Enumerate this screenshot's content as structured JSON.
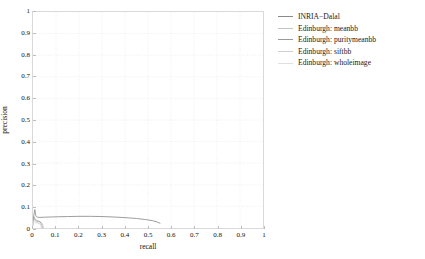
{
  "chart_data": {
    "type": "line",
    "title": "",
    "xlabel": "recall",
    "ylabel": "precision",
    "xlim": [
      0,
      1
    ],
    "ylim": [
      0,
      1
    ],
    "xticks": [
      "0",
      "0.1",
      "0.2",
      "0.3",
      "0.4",
      "0.5",
      "0.6",
      "0.7",
      "0.8",
      "0.9",
      "1"
    ],
    "xtick_values": [
      0,
      0.1,
      0.2,
      0.3,
      0.4,
      0.5,
      0.6,
      0.7,
      0.8,
      0.9,
      1
    ],
    "yticks": [
      "0",
      "0.1",
      "0.2",
      "0.3",
      "0.4",
      "0.5",
      "0.6",
      "0.7",
      "0.8",
      "0.9",
      "1"
    ],
    "ytick_values": [
      0,
      0.1,
      0.2,
      0.3,
      0.4,
      0.5,
      0.6,
      0.7,
      0.8,
      0.9,
      1
    ],
    "grid": true,
    "grid_style": "dotted",
    "legend_position": "right-outside",
    "series": [
      {
        "name": "INRIA-Dalal",
        "color": "#8a8a8a",
        "points": [
          [
            0.0,
            0.02
          ],
          [
            0.002,
            0.048
          ],
          [
            0.004,
            0.062
          ],
          [
            0.006,
            0.074
          ],
          [
            0.008,
            0.085
          ],
          [
            0.01,
            0.07
          ],
          [
            0.012,
            0.058
          ],
          [
            0.015,
            0.052
          ],
          [
            0.02,
            0.05
          ],
          [
            0.03,
            0.049
          ],
          [
            0.05,
            0.05
          ],
          [
            0.08,
            0.051
          ],
          [
            0.11,
            0.052
          ],
          [
            0.15,
            0.053
          ],
          [
            0.2,
            0.054
          ],
          [
            0.25,
            0.054
          ],
          [
            0.3,
            0.053
          ],
          [
            0.35,
            0.051
          ],
          [
            0.4,
            0.048
          ],
          [
            0.45,
            0.044
          ],
          [
            0.49,
            0.039
          ],
          [
            0.52,
            0.034
          ],
          [
            0.54,
            0.028
          ],
          [
            0.552,
            0.022
          ]
        ]
      },
      {
        "name": "Edinburgh: meanbb",
        "color": "#c4c4c4",
        "points": [
          [
            0.0,
            0.015
          ],
          [
            0.002,
            0.034
          ],
          [
            0.004,
            0.044
          ],
          [
            0.006,
            0.04
          ],
          [
            0.009,
            0.036
          ],
          [
            0.013,
            0.033
          ],
          [
            0.018,
            0.031
          ],
          [
            0.024,
            0.03
          ],
          [
            0.03,
            0.029
          ],
          [
            0.036,
            0.026
          ],
          [
            0.04,
            0.02
          ],
          [
            0.043,
            0.012
          ],
          [
            0.045,
            0.005
          ],
          [
            0.046,
            0.0
          ]
        ]
      },
      {
        "name": "Edinburgh: puritymeanbb",
        "color": "#9a9a9a",
        "points": [
          [
            0.0,
            0.018
          ],
          [
            0.002,
            0.04
          ],
          [
            0.004,
            0.052
          ],
          [
            0.006,
            0.046
          ],
          [
            0.009,
            0.042
          ],
          [
            0.012,
            0.038
          ],
          [
            0.016,
            0.035
          ],
          [
            0.021,
            0.033
          ],
          [
            0.026,
            0.031
          ],
          [
            0.031,
            0.028
          ],
          [
            0.035,
            0.022
          ],
          [
            0.038,
            0.014
          ],
          [
            0.04,
            0.006
          ],
          [
            0.041,
            0.0
          ]
        ]
      },
      {
        "name": "Edinburgh: siftbb",
        "color": "#d0d0d0",
        "points": [
          [
            0.0,
            0.012
          ],
          [
            0.002,
            0.028
          ],
          [
            0.004,
            0.036
          ],
          [
            0.006,
            0.033
          ],
          [
            0.009,
            0.03
          ],
          [
            0.013,
            0.028
          ],
          [
            0.017,
            0.026
          ],
          [
            0.022,
            0.025
          ],
          [
            0.027,
            0.023
          ],
          [
            0.031,
            0.018
          ],
          [
            0.034,
            0.011
          ],
          [
            0.036,
            0.004
          ],
          [
            0.037,
            0.0
          ]
        ]
      },
      {
        "name": "Edinburgh: wholeimage",
        "color": "#e0e0e0",
        "points": [
          [
            0.0,
            0.01
          ],
          [
            0.003,
            0.022
          ],
          [
            0.006,
            0.026
          ],
          [
            0.01,
            0.024
          ],
          [
            0.015,
            0.022
          ],
          [
            0.021,
            0.021
          ],
          [
            0.027,
            0.02
          ],
          [
            0.033,
            0.018
          ],
          [
            0.038,
            0.013
          ],
          [
            0.042,
            0.007
          ],
          [
            0.045,
            0.002
          ],
          [
            0.046,
            0.0
          ]
        ]
      }
    ]
  },
  "legend": {
    "entries": [
      {
        "label": "INRIA−Dalal",
        "color": "#8a8a8a"
      },
      {
        "label": "Edinburgh: meanbb",
        "color": "#c4c4c4"
      },
      {
        "label": "Edinburgh: puritymeanbb",
        "color": "#9a9a9a"
      },
      {
        "label": "Edinburgh: siftbb",
        "color": "#d0d0d0"
      },
      {
        "label": "Edinburgh: wholeimage",
        "color": "#e0e0e0"
      }
    ]
  },
  "axes": {
    "x_title": "recall",
    "y_title": "precision"
  },
  "colors": {
    "background": "#ffffff",
    "axis": "#bdbdbd",
    "grid": "#ebebeb",
    "text": "#111111"
  }
}
